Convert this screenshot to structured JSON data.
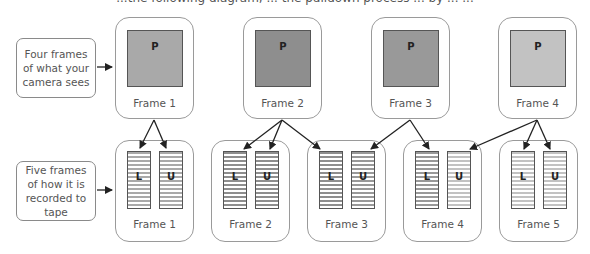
{
  "header": {
    "cut_off_text": "...the following diagram, ... the pulldown process ... by ... ..."
  },
  "labels": {
    "camera": "Four frames of what your camera sees",
    "tape": "Five frames of how it is recorded to tape"
  },
  "camera_frames": [
    {
      "label": "Frame 1",
      "picture_letter": "P",
      "color": "#a9a9a9"
    },
    {
      "label": "Frame 2",
      "picture_letter": "P",
      "color": "#8e8e8e"
    },
    {
      "label": "Frame 3",
      "picture_letter": "P",
      "color": "#999999"
    },
    {
      "label": "Frame 4",
      "picture_letter": "P",
      "color": "#c2c2c2"
    }
  ],
  "tape_frames": [
    {
      "label": "Frame 1",
      "lower": {
        "letter": "L",
        "stripe": "#a9a9a9"
      },
      "upper": {
        "letter": "U",
        "stripe": "#a9a9a9"
      }
    },
    {
      "label": "Frame 2",
      "lower": {
        "letter": "L",
        "stripe": "#8e8e8e"
      },
      "upper": {
        "letter": "U",
        "stripe": "#8e8e8e"
      }
    },
    {
      "label": "Frame 3",
      "lower": {
        "letter": "L",
        "stripe": "#8e8e8e"
      },
      "upper": {
        "letter": "U",
        "stripe": "#999999"
      }
    },
    {
      "label": "Frame 4",
      "lower": {
        "letter": "L",
        "stripe": "#999999"
      },
      "upper": {
        "letter": "U",
        "stripe": "#c2c2c2"
      }
    },
    {
      "label": "Frame 5",
      "lower": {
        "letter": "L",
        "stripe": "#c2c2c2"
      },
      "upper": {
        "letter": "U",
        "stripe": "#c2c2c2"
      }
    }
  ]
}
